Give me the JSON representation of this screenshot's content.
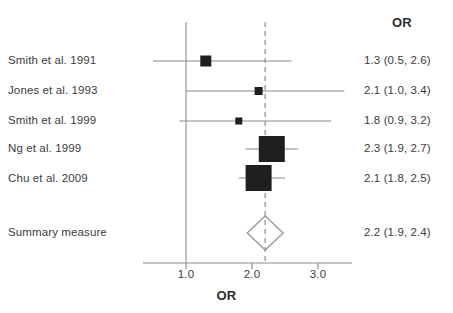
{
  "figure": {
    "type": "forest-plot",
    "column_header": "OR",
    "axis_title": "OR"
  },
  "chart_data": {
    "type": "forest",
    "title": "",
    "xlabel": "OR",
    "ylabel": "",
    "xlim": [
      0.35,
      3.55
    ],
    "ticks": [
      "1.0",
      "2.0",
      "3.0"
    ],
    "tick_values": [
      1.0,
      2.0,
      3.0
    ],
    "grid": false,
    "null_line": 1.0,
    "summary_line": 2.2,
    "effect_measure": "OR",
    "value_header": "OR",
    "rows": [
      {
        "label": "Smith et al. 1991",
        "estimate": 1.3,
        "ci_low": 0.5,
        "ci_high": 2.6,
        "value_text": "1.3 (0.5, 2.6)",
        "marker": "square",
        "marker_size": 11
      },
      {
        "label": "Jones et al. 1993",
        "estimate": 2.1,
        "ci_low": 1.0,
        "ci_high": 3.4,
        "value_text": "2.1 (1.0, 3.4)",
        "marker": "square",
        "marker_size": 8
      },
      {
        "label": "Smith et al. 1999",
        "estimate": 1.8,
        "ci_low": 0.9,
        "ci_high": 3.2,
        "value_text": "1.8 (0.9, 3.2)",
        "marker": "square",
        "marker_size": 7
      },
      {
        "label": "Ng et al. 1999",
        "estimate": 2.3,
        "ci_low": 1.9,
        "ci_high": 2.7,
        "value_text": "2.3 (1.9, 2.7)",
        "marker": "square",
        "marker_size": 26
      },
      {
        "label": "Chu et al. 2009",
        "estimate": 2.1,
        "ci_low": 1.8,
        "ci_high": 2.5,
        "value_text": "2.1 (1.8, 2.5)",
        "marker": "square",
        "marker_size": 26
      }
    ],
    "summary": {
      "label": "Summary measure",
      "estimate": 2.2,
      "ci_low": 1.9,
      "ci_high": 2.4,
      "value_text": "2.2 (1.9, 2.4)",
      "marker": "diamond"
    }
  },
  "colors": {
    "marker": "#1f1f1f",
    "line": "#8c8c8c",
    "axis": "#8c8c8c",
    "null_line": "#8c8c8c",
    "summary_line": "#b0b0b0",
    "diamond_stroke": "#9a9a9a",
    "text": "#3c3c3c",
    "background": "#ffffff"
  },
  "labels": {
    "rows": [
      "Smith et al. 1991",
      "Jones et al. 1993",
      "Smith et al. 1999",
      "Ng et al. 1999",
      "Chu et al. 2009",
      "Summary measure"
    ],
    "values": [
      "1.3 (0.5, 2.6)",
      "2.1 (1.0, 3.4)",
      "1.8 (0.9, 3.2)",
      "2.3 (1.9, 2.7)",
      "2.1 (1.8, 2.5)",
      "2.2 (1.9, 2.4)"
    ],
    "ticks": [
      "1.0",
      "2.0",
      "3.0"
    ]
  }
}
